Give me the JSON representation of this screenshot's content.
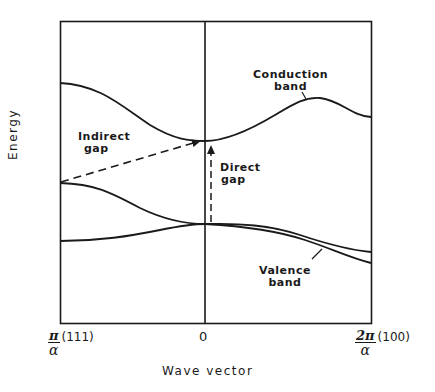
{
  "diagram": {
    "type": "band-structure",
    "y_axis_label": "Energy",
    "x_axis_label": "Wave vector",
    "x_ticks": {
      "left": {
        "numerator": "π",
        "denominator": "α",
        "direction": "(111)"
      },
      "center": "0",
      "right": {
        "numerator": "2π",
        "denominator": "α",
        "direction": "(100)"
      }
    },
    "labels": {
      "conduction_line1": "Conduction",
      "conduction_line2": "band",
      "indirect_line1": "Indirect",
      "indirect_line2": "gap",
      "direct_line1": "Direct",
      "direct_line2": "gap",
      "valence_line1": "Valence",
      "valence_line2": "band"
    },
    "curves": [
      {
        "name": "conduction-band",
        "description": "starts high at π/α, dips to minimum at 0, rises to a peak near 3/4 toward 2π/α, then falls"
      },
      {
        "name": "upper-valence-band",
        "description": "starts mid at π/α, falls to meet at 0, then descends toward 2π/α"
      },
      {
        "name": "lower-valence-band",
        "description": "starts low at π/α, rises to meet at 0, then descends more steeply toward 2π/α"
      }
    ],
    "arrows": [
      {
        "name": "indirect-gap-arrow",
        "style": "dashed",
        "from": "valence maximum at π/α",
        "to": "conduction minimum at 0"
      },
      {
        "name": "direct-gap-arrow",
        "style": "dashed",
        "from": "valence top at 0",
        "to": "conduction minimum at 0"
      }
    ],
    "colors": {
      "ink": "#1a1a1a",
      "background": "#ffffff"
    }
  }
}
